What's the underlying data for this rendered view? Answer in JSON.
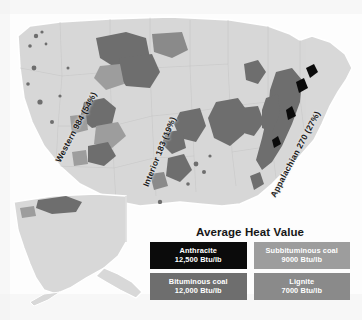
{
  "figure": {
    "background_color": "#fdfdfd"
  },
  "map": {
    "land_color": "#d8d8d8",
    "land_outline_color": "#ffffff",
    "state_border_color": "#c2c2c2",
    "water_color": "#f4f4f4",
    "alaska_inset_label": "",
    "regions": [
      {
        "id": "western",
        "label": "Western 984 (54%)",
        "name": "Western",
        "amount": "984",
        "share": "54%"
      },
      {
        "id": "interior",
        "label": "Interior 183 (19%)",
        "name": "Interior",
        "amount": "183",
        "share": "19%"
      },
      {
        "id": "appalachian",
        "label": "Appalachian 270 (27%)",
        "name": "Appalachian",
        "amount": "270",
        "share": "27%"
      }
    ]
  },
  "legend": {
    "title": "Average Heat Value",
    "cells": [
      {
        "name": "Anthracite",
        "value": "12,500 Btu/lb",
        "color": "#0b0b0b",
        "text_color": "#ffffff"
      },
      {
        "name": "Subbituminous coal",
        "value": "9000 Btu/lb",
        "color": "#9d9d9d",
        "text_color": "#ffffff"
      },
      {
        "name": "Bituminous coal",
        "value": "12,000 Btu/lb",
        "color": "#6e6e6e",
        "text_color": "#ffffff"
      },
      {
        "name": "Lignite",
        "value": "7000 Btu/lb",
        "color": "#8a8a8a",
        "text_color": "#ffffff"
      }
    ]
  },
  "colors": {
    "anthracite": "#0b0b0b",
    "bituminous": "#6e6e6e",
    "subbituminous": "#9d9d9d",
    "lignite": "#8a8a8a",
    "land": "#d8d8d8"
  }
}
